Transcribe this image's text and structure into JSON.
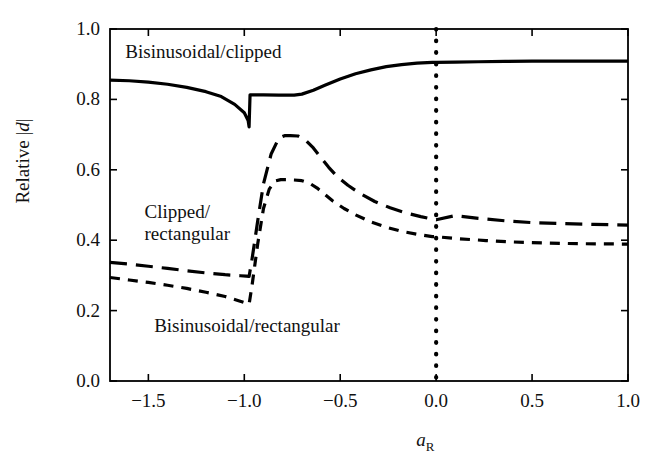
{
  "chart_data": {
    "type": "line",
    "title": "",
    "xlabel": "a_R",
    "xlabel_base": "a",
    "xlabel_sub": "R",
    "ylabel": "Relative |d|",
    "ylabel_prefix": "Relative ",
    "ylabel_var": "d",
    "xlim": [
      -1.7,
      1.0
    ],
    "ylim": [
      0.0,
      1.0
    ],
    "grid": false,
    "legend_position": "inline-annotations",
    "x_ticks": [
      -1.5,
      -1.0,
      -0.5,
      0.0,
      0.5,
      1.0
    ],
    "x_tick_labels": [
      "−1.5",
      "−1.0",
      "−0.5",
      "0.0",
      "0.5",
      "1.0"
    ],
    "y_ticks": [
      0.0,
      0.2,
      0.4,
      0.6,
      0.8,
      1.0
    ],
    "y_tick_labels": [
      "0.0",
      "0.2",
      "0.4",
      "0.6",
      "0.8",
      "1.0"
    ],
    "annotations": [
      {
        "name": "bisinusoidal-clipped",
        "text": "Bisinusoidal/clipped",
        "x": -1.62,
        "y": 0.935
      },
      {
        "name": "clipped-rectangular",
        "text": "Clipped/\nrectangular",
        "x": -1.52,
        "y": 0.48
      },
      {
        "name": "bisinusoidal-rectangular",
        "text": "Bisinusoidal/rectangular",
        "x": -1.47,
        "y": 0.155
      }
    ],
    "reference_line": {
      "name": "zero-reference",
      "orientation": "vertical",
      "x": 0.0,
      "style": "dotted"
    },
    "series": [
      {
        "name": "Bisinusoidal/clipped",
        "style": "solid",
        "color": "#000000",
        "x": [
          -1.7,
          -1.6,
          -1.5,
          -1.4,
          -1.3,
          -1.2,
          -1.12,
          -1.05,
          -1.0,
          -0.98,
          -0.975,
          -0.97,
          -0.9,
          -0.82,
          -0.78,
          -0.74,
          -0.7,
          -0.64,
          -0.58,
          -0.5,
          -0.42,
          -0.34,
          -0.26,
          -0.18,
          -0.1,
          -0.02,
          0.0,
          0.1,
          0.22,
          0.36,
          0.5,
          0.66,
          0.82,
          1.0
        ],
        "y": [
          0.855,
          0.853,
          0.849,
          0.843,
          0.834,
          0.822,
          0.808,
          0.786,
          0.762,
          0.74,
          0.722,
          0.813,
          0.813,
          0.812,
          0.812,
          0.812,
          0.815,
          0.826,
          0.84,
          0.858,
          0.873,
          0.884,
          0.893,
          0.899,
          0.903,
          0.905,
          0.905,
          0.906,
          0.907,
          0.908,
          0.909,
          0.909,
          0.909,
          0.909
        ]
      },
      {
        "name": "Clipped/rectangular",
        "style": "long-dash",
        "color": "#000000",
        "x": [
          -1.7,
          -1.6,
          -1.5,
          -1.4,
          -1.3,
          -1.2,
          -1.1,
          -1.02,
          -0.99,
          -0.975,
          -0.96,
          -0.93,
          -0.9,
          -0.86,
          -0.82,
          -0.79,
          -0.76,
          -0.72,
          -0.68,
          -0.64,
          -0.6,
          -0.56,
          -0.52,
          -0.46,
          -0.4,
          -0.32,
          -0.24,
          -0.16,
          -0.08,
          0.0,
          0.1,
          0.22,
          0.36,
          0.5,
          0.66,
          0.82,
          1.0
        ],
        "y": [
          0.337,
          0.332,
          0.326,
          0.32,
          0.313,
          0.307,
          0.302,
          0.299,
          0.298,
          0.297,
          0.345,
          0.455,
          0.56,
          0.645,
          0.69,
          0.697,
          0.697,
          0.696,
          0.684,
          0.662,
          0.634,
          0.607,
          0.583,
          0.556,
          0.534,
          0.51,
          0.492,
          0.478,
          0.467,
          0.458,
          0.47,
          0.462,
          0.455,
          0.45,
          0.447,
          0.445,
          0.443
        ]
      },
      {
        "name": "Bisinusoidal/rectangular",
        "style": "short-dash",
        "color": "#000000",
        "x": [
          -1.7,
          -1.6,
          -1.5,
          -1.4,
          -1.3,
          -1.2,
          -1.1,
          -1.03,
          -0.99,
          -0.975,
          -0.96,
          -0.93,
          -0.9,
          -0.87,
          -0.84,
          -0.81,
          -0.78,
          -0.74,
          -0.7,
          -0.66,
          -0.62,
          -0.58,
          -0.54,
          -0.48,
          -0.42,
          -0.34,
          -0.26,
          -0.18,
          -0.1,
          -0.02,
          0.0,
          0.12,
          0.26,
          0.4,
          0.56,
          0.74,
          1.0
        ],
        "y": [
          0.294,
          0.287,
          0.28,
          0.272,
          0.263,
          0.252,
          0.24,
          0.228,
          0.221,
          0.218,
          0.27,
          0.39,
          0.49,
          0.545,
          0.568,
          0.572,
          0.572,
          0.571,
          0.569,
          0.562,
          0.548,
          0.53,
          0.512,
          0.49,
          0.472,
          0.452,
          0.437,
          0.425,
          0.417,
          0.41,
          0.41,
          0.404,
          0.399,
          0.395,
          0.392,
          0.39,
          0.389
        ]
      }
    ]
  },
  "axes": {
    "frame": {
      "left_px": 110,
      "right_px": 628,
      "top_px": 29,
      "bottom_px": 381
    }
  }
}
